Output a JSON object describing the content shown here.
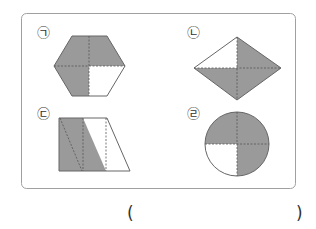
{
  "problem": {
    "labels": [
      "㉠",
      "㉡",
      "㉢",
      "㉣"
    ],
    "figures": [
      {
        "label": "㉠",
        "shape": "hexagon",
        "parts": 4,
        "shaded_parts": 3
      },
      {
        "label": "㉡",
        "shape": "rhombus",
        "parts": 4,
        "shaded_parts": 3
      },
      {
        "label": "㉢",
        "shape": "trapezoid",
        "parts": 4,
        "shaded_parts": 2
      },
      {
        "label": "㉣",
        "shape": "circle",
        "parts": 4,
        "shaded_parts": 3
      }
    ],
    "answer_open": "(",
    "answer_close": ")",
    "answer_value": ""
  },
  "colors": {
    "shade": "#9a9a9a",
    "stroke": "#555555",
    "border": "#a0a0a0"
  }
}
